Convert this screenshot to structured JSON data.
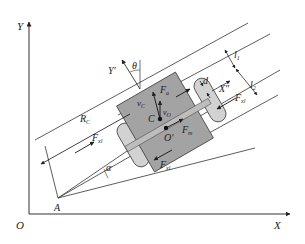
{
  "diagram": {
    "type": "vehicle-kinematics-schematic",
    "axes": {
      "origin": "O",
      "x_axis": "X",
      "y_axis": "Y",
      "body_x_axis": "X″",
      "body_y_axis": "Y′"
    },
    "points": {
      "pivot": "A",
      "center_of_mass": "C",
      "geometric_center": "O′"
    },
    "angles": {
      "heading": "θ",
      "turn": "α"
    },
    "dimensions": {
      "turn_radius": {
        "main": "R",
        "sub": "C"
      },
      "offset": "d",
      "l1": {
        "main": "l",
        "sub": "1"
      },
      "l2": {
        "main": "l",
        "sub": "2"
      }
    },
    "vectors": {
      "velocity_c": {
        "main": "v",
        "sub": "C"
      },
      "velocity_o": {
        "main": "v",
        "sub": "O"
      },
      "force_fa": {
        "main": "F",
        "sub": "a"
      },
      "force_fm": {
        "main": "F",
        "sub": "m"
      },
      "force_left": {
        "main": "F",
        "sub": "xl"
      },
      "force_right": {
        "main": "F",
        "sub": "xl"
      },
      "force_rear": {
        "main": "F",
        "sub": "xl"
      }
    },
    "colors": {
      "body": "#a3a3a3",
      "wheel": "#d2d2d2",
      "line": "#333333"
    }
  }
}
